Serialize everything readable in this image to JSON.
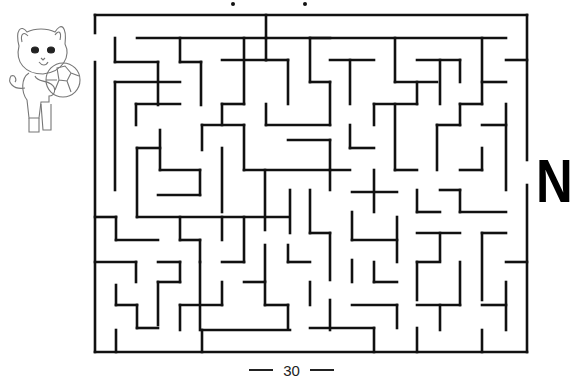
{
  "page": {
    "letter": "N",
    "page_number": "30"
  },
  "colors": {
    "wall": "#111111",
    "background": "#ffffff",
    "illustration_line": "#777777"
  },
  "illustration": {
    "subject": "cat-holding-soccer-ball"
  },
  "maze": {
    "frame": {
      "left": 95,
      "top": 15,
      "right": 527,
      "bottom": 352
    },
    "entrance": {
      "side": "left",
      "y_from": 33,
      "y_to": 62
    },
    "exit": {
      "side": "right",
      "y_from": 160,
      "y_to": 185
    },
    "walls": [
      [
        95,
        15,
        527,
        15
      ],
      [
        95,
        15,
        95,
        33
      ],
      [
        95,
        62,
        95,
        352
      ],
      [
        95,
        352,
        527,
        352
      ],
      [
        527,
        15,
        527,
        160
      ],
      [
        527,
        185,
        527,
        352
      ],
      [
        137,
        38,
        330,
        38
      ],
      [
        310,
        38,
        506,
        38
      ],
      [
        266,
        15,
        266,
        38
      ],
      [
        115,
        38,
        115,
        62
      ],
      [
        115,
        62,
        158,
        62
      ],
      [
        158,
        62,
        158,
        105
      ],
      [
        180,
        38,
        180,
        62
      ],
      [
        180,
        62,
        201,
        62
      ],
      [
        201,
        62,
        201,
        105
      ],
      [
        222,
        60,
        266,
        60
      ],
      [
        244,
        38,
        244,
        104
      ],
      [
        244,
        104,
        222,
        104
      ],
      [
        222,
        104,
        222,
        125
      ],
      [
        266,
        38,
        266,
        60
      ],
      [
        266,
        60,
        288,
        60
      ],
      [
        288,
        60,
        288,
        104
      ],
      [
        310,
        38,
        310,
        82
      ],
      [
        310,
        82,
        330,
        82
      ],
      [
        330,
        82,
        330,
        125
      ],
      [
        330,
        60,
        374,
        60
      ],
      [
        350,
        60,
        350,
        104
      ],
      [
        395,
        38,
        395,
        82
      ],
      [
        395,
        82,
        437,
        82
      ],
      [
        417,
        60,
        460,
        60
      ],
      [
        440,
        60,
        440,
        104
      ],
      [
        460,
        60,
        460,
        82
      ],
      [
        482,
        38,
        482,
        104
      ],
      [
        482,
        82,
        506,
        82
      ],
      [
        506,
        60,
        527,
        60
      ],
      [
        115,
        82,
        180,
        82
      ],
      [
        115,
        82,
        115,
        190
      ],
      [
        136,
        104,
        180,
        104
      ],
      [
        136,
        104,
        136,
        125
      ],
      [
        266,
        104,
        266,
        125
      ],
      [
        266,
        125,
        330,
        125
      ],
      [
        202,
        125,
        202,
        150
      ],
      [
        202,
        125,
        244,
        125
      ],
      [
        244,
        125,
        244,
        170
      ],
      [
        160,
        130,
        160,
        170
      ],
      [
        160,
        170,
        200,
        170
      ],
      [
        288,
        140,
        330,
        140
      ],
      [
        330,
        140,
        330,
        170
      ],
      [
        350,
        125,
        350,
        148
      ],
      [
        350,
        148,
        374,
        148
      ],
      [
        374,
        104,
        374,
        125
      ],
      [
        374,
        104,
        417,
        104
      ],
      [
        417,
        82,
        417,
        104
      ],
      [
        395,
        104,
        395,
        170
      ],
      [
        395,
        170,
        417,
        170
      ],
      [
        437,
        125,
        437,
        170
      ],
      [
        437,
        125,
        460,
        125
      ],
      [
        460,
        104,
        460,
        125
      ],
      [
        460,
        104,
        482,
        104
      ],
      [
        482,
        125,
        506,
        125
      ],
      [
        506,
        104,
        506,
        190
      ],
      [
        482,
        148,
        482,
        170
      ],
      [
        482,
        170,
        460,
        170
      ],
      [
        137,
        148,
        137,
        217
      ],
      [
        137,
        148,
        160,
        148
      ],
      [
        222,
        148,
        222,
        212
      ],
      [
        200,
        170,
        200,
        195
      ],
      [
        158,
        195,
        200,
        195
      ],
      [
        244,
        170,
        350,
        170
      ],
      [
        265,
        170,
        265,
        230
      ],
      [
        330,
        170,
        330,
        190
      ],
      [
        352,
        192,
        397,
        192
      ],
      [
        374,
        170,
        374,
        212
      ],
      [
        310,
        190,
        310,
        233
      ],
      [
        290,
        190,
        290,
        233
      ],
      [
        417,
        190,
        417,
        212
      ],
      [
        417,
        212,
        440,
        212
      ],
      [
        440,
        190,
        460,
        190
      ],
      [
        460,
        190,
        460,
        212
      ],
      [
        95,
        217,
        116,
        217
      ],
      [
        116,
        217,
        116,
        240
      ],
      [
        116,
        240,
        158,
        240
      ],
      [
        137,
        217,
        288,
        217
      ],
      [
        180,
        217,
        180,
        240
      ],
      [
        180,
        240,
        200,
        240
      ],
      [
        200,
        240,
        200,
        262
      ],
      [
        222,
        217,
        222,
        240
      ],
      [
        244,
        217,
        244,
        262
      ],
      [
        310,
        233,
        330,
        233
      ],
      [
        330,
        233,
        330,
        280
      ],
      [
        352,
        212,
        352,
        240
      ],
      [
        352,
        240,
        397,
        240
      ],
      [
        397,
        217,
        397,
        262
      ],
      [
        417,
        233,
        460,
        233
      ],
      [
        440,
        233,
        440,
        260
      ],
      [
        460,
        212,
        506,
        212
      ],
      [
        482,
        233,
        506,
        233
      ],
      [
        482,
        233,
        482,
        300
      ],
      [
        95,
        262,
        136,
        262
      ],
      [
        136,
        262,
        136,
        282
      ],
      [
        158,
        262,
        180,
        262
      ],
      [
        180,
        262,
        180,
        282
      ],
      [
        158,
        282,
        180,
        282
      ],
      [
        158,
        282,
        158,
        325
      ],
      [
        200,
        262,
        200,
        330
      ],
      [
        222,
        262,
        244,
        262
      ],
      [
        265,
        245,
        265,
        280
      ],
      [
        288,
        245,
        288,
        262
      ],
      [
        288,
        262,
        310,
        262
      ],
      [
        352,
        260,
        352,
        282
      ],
      [
        374,
        262,
        374,
        282
      ],
      [
        374,
        282,
        397,
        282
      ],
      [
        417,
        262,
        417,
        300
      ],
      [
        417,
        262,
        440,
        262
      ],
      [
        460,
        262,
        460,
        305
      ],
      [
        506,
        262,
        527,
        262
      ],
      [
        116,
        285,
        116,
        305
      ],
      [
        116,
        305,
        137,
        305
      ],
      [
        137,
        305,
        137,
        328
      ],
      [
        137,
        328,
        158,
        328
      ],
      [
        222,
        282,
        222,
        305
      ],
      [
        244,
        282,
        265,
        282
      ],
      [
        265,
        282,
        265,
        305
      ],
      [
        265,
        305,
        288,
        305
      ],
      [
        288,
        305,
        288,
        328
      ],
      [
        310,
        282,
        310,
        305
      ],
      [
        330,
        300,
        330,
        330
      ],
      [
        310,
        328,
        374,
        328
      ],
      [
        352,
        305,
        397,
        305
      ],
      [
        397,
        305,
        397,
        328
      ],
      [
        417,
        305,
        460,
        305
      ],
      [
        440,
        305,
        440,
        330
      ],
      [
        482,
        305,
        506,
        305
      ],
      [
        506,
        282,
        506,
        330
      ],
      [
        116,
        330,
        116,
        352
      ],
      [
        180,
        305,
        222,
        305
      ],
      [
        180,
        305,
        180,
        330
      ],
      [
        202,
        330,
        202,
        352
      ],
      [
        202,
        330,
        290,
        330
      ],
      [
        374,
        328,
        374,
        352
      ],
      [
        417,
        328,
        417,
        352
      ],
      [
        482,
        330,
        482,
        352
      ]
    ]
  }
}
